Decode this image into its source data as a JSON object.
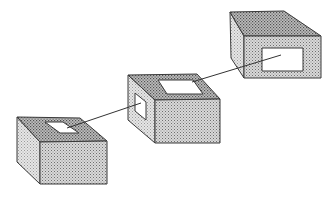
{
  "diagram": {
    "colors": {
      "background": "#ffffff",
      "outline": "#3a3a3a",
      "front_face": "#bdbdbd",
      "top_face": "#9a9a9a",
      "side_face": "#d6d6d6",
      "opening": "#ffffff",
      "connector": "#333333"
    },
    "boxes": [
      {
        "id": "box-left",
        "top_face": "17,117 80,118 107,141 40,142",
        "front_face": "40,142 107,141 107,184 40,184",
        "side_face": "17,117 40,142 40,184 17,162",
        "openings": [
          {
            "face": "top",
            "points": "45,122 63,122 79,133 60,133"
          }
        ]
      },
      {
        "id": "box-middle",
        "top_face": "128,75 197,74 220,99 155,100",
        "front_face": "155,100 220,99 220,143 155,143",
        "side_face": "128,75 155,100 155,143 128,120",
        "openings": [
          {
            "face": "top",
            "points": "158,80 193,80 203,94 167,94"
          },
          {
            "face": "side",
            "points": "135,93 146,102 146,120 135,111"
          }
        ]
      },
      {
        "id": "box-right",
        "top_face": "230,12 284,11 321,36 244,36",
        "front_face": "244,36 321,36 321,78 244,78",
        "side_face": "230,12 244,36 244,78 231,58",
        "openings": [
          {
            "face": "front",
            "points": "262,48 303,48 303,71 262,71"
          }
        ]
      }
    ],
    "connectors": [
      {
        "id": "link-1",
        "from": [
          67,
          128
        ],
        "to": [
          141,
          103
        ]
      },
      {
        "id": "link-2",
        "from": [
          192,
          82
        ],
        "to": [
          281,
          55
        ]
      }
    ]
  }
}
